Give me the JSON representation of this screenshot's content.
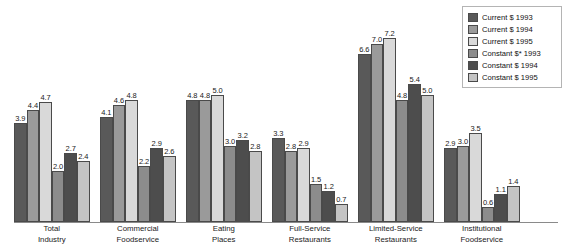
{
  "chart_data": {
    "type": "bar",
    "title": "",
    "xlabel": "",
    "ylabel": "",
    "ylim": [
      0,
      7.6
    ],
    "grid": false,
    "legend_position": "top-right",
    "categories": [
      "Total Industry",
      "Commercial Foodservice",
      "Eating Places",
      "Full-Service Restaurants",
      "Limited-Service Restaurants",
      "Institutional Foodservice"
    ],
    "series": [
      {
        "name": "Current $ 1993",
        "color": "#595959",
        "values": [
          3.9,
          4.1,
          4.8,
          3.3,
          6.6,
          2.9
        ]
      },
      {
        "name": "Current $ 1994",
        "color": "#9a9a9a",
        "values": [
          4.4,
          4.6,
          4.8,
          2.8,
          7.0,
          3.0
        ]
      },
      {
        "name": "Current $ 1995",
        "color": "#d9d9d9",
        "values": [
          4.7,
          4.8,
          5.0,
          2.9,
          7.2,
          3.5
        ]
      },
      {
        "name": "Constant $* 1993",
        "color": "#8c8c8c",
        "values": [
          2.0,
          2.2,
          3.0,
          1.5,
          4.8,
          0.6
        ]
      },
      {
        "name": "Constant $ 1994",
        "color": "#4d4d4d",
        "values": [
          2.7,
          2.9,
          3.2,
          1.2,
          5.4,
          1.1
        ]
      },
      {
        "name": "Constant $ 1995",
        "color": "#c4c4c4",
        "values": [
          2.4,
          2.6,
          2.8,
          0.7,
          5.0,
          1.4
        ]
      }
    ]
  },
  "groups": [
    {
      "label_line1": "Total",
      "label_line2": "Industry",
      "bars": [
        {
          "value": "3.9",
          "num": 3.9,
          "color": "#595959"
        },
        {
          "value": "4.4",
          "num": 4.4,
          "color": "#9a9a9a"
        },
        {
          "value": "4.7",
          "num": 4.7,
          "color": "#d9d9d9"
        },
        {
          "value": "2.0",
          "num": 2.0,
          "color": "#8c8c8c"
        },
        {
          "value": "2.7",
          "num": 2.7,
          "color": "#4d4d4d"
        },
        {
          "value": "2.4",
          "num": 2.4,
          "color": "#c4c4c4"
        }
      ]
    },
    {
      "label_line1": "Commercial",
      "label_line2": "Foodservice",
      "bars": [
        {
          "value": "4.1",
          "num": 4.1,
          "color": "#595959"
        },
        {
          "value": "4.6",
          "num": 4.6,
          "color": "#9a9a9a"
        },
        {
          "value": "4.8",
          "num": 4.8,
          "color": "#d9d9d9"
        },
        {
          "value": "2.2",
          "num": 2.2,
          "color": "#8c8c8c"
        },
        {
          "value": "2.9",
          "num": 2.9,
          "color": "#4d4d4d"
        },
        {
          "value": "2.6",
          "num": 2.6,
          "color": "#c4c4c4"
        }
      ]
    },
    {
      "label_line1": "Eating",
      "label_line2": "Places",
      "bars": [
        {
          "value": "4.8",
          "num": 4.8,
          "color": "#595959"
        },
        {
          "value": "4.8",
          "num": 4.8,
          "color": "#9a9a9a"
        },
        {
          "value": "5.0",
          "num": 5.0,
          "color": "#d9d9d9"
        },
        {
          "value": "3.0",
          "num": 3.0,
          "color": "#8c8c8c"
        },
        {
          "value": "3.2",
          "num": 3.2,
          "color": "#4d4d4d"
        },
        {
          "value": "2.8",
          "num": 2.8,
          "color": "#c4c4c4"
        }
      ]
    },
    {
      "label_line1": "Full-Service",
      "label_line2": "Restaurants",
      "bars": [
        {
          "value": "3.3",
          "num": 3.3,
          "color": "#595959"
        },
        {
          "value": "2.8",
          "num": 2.8,
          "color": "#9a9a9a"
        },
        {
          "value": "2.9",
          "num": 2.9,
          "color": "#d9d9d9"
        },
        {
          "value": "1.5",
          "num": 1.5,
          "color": "#8c8c8c"
        },
        {
          "value": "1.2",
          "num": 1.2,
          "color": "#4d4d4d"
        },
        {
          "value": "0.7",
          "num": 0.7,
          "color": "#c4c4c4"
        }
      ]
    },
    {
      "label_line1": "Limited-Service",
      "label_line2": "Restaurants",
      "bars": [
        {
          "value": "6.6",
          "num": 6.6,
          "color": "#595959"
        },
        {
          "value": "7.0",
          "num": 7.0,
          "color": "#9a9a9a"
        },
        {
          "value": "7.2",
          "num": 7.2,
          "color": "#d9d9d9"
        },
        {
          "value": "4.8",
          "num": 4.8,
          "color": "#8c8c8c"
        },
        {
          "value": "5.4",
          "num": 5.4,
          "color": "#4d4d4d"
        },
        {
          "value": "5.0",
          "num": 5.0,
          "color": "#c4c4c4"
        }
      ]
    },
    {
      "label_line1": "Institutional",
      "label_line2": "Foodservice",
      "bars": [
        {
          "value": "2.9",
          "num": 2.9,
          "color": "#595959"
        },
        {
          "value": "3.0",
          "num": 3.0,
          "color": "#9a9a9a"
        },
        {
          "value": "3.5",
          "num": 3.5,
          "color": "#d9d9d9"
        },
        {
          "value": "0.6",
          "num": 0.6,
          "color": "#8c8c8c"
        },
        {
          "value": "1.1",
          "num": 1.1,
          "color": "#4d4d4d"
        },
        {
          "value": "1.4",
          "num": 1.4,
          "color": "#c4c4c4"
        }
      ]
    }
  ],
  "legend": {
    "items": [
      {
        "label": "Current $ 1993",
        "color": "#595959"
      },
      {
        "label": "Current $ 1994",
        "color": "#9a9a9a"
      },
      {
        "label": "Current $ 1995",
        "color": "#d9d9d9"
      },
      {
        "label": "Constant $* 1993",
        "color": "#8c8c8c"
      },
      {
        "label": "Constant $ 1994",
        "color": "#4d4d4d"
      },
      {
        "label": "Constant $ 1995",
        "color": "#c4c4c4"
      }
    ]
  },
  "scale": {
    "baseline_y": 222,
    "px_per_unit": 25.5
  }
}
